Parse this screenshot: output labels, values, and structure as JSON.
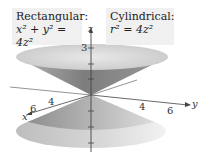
{
  "labels": {
    "rectangular": {
      "title": "Rectangular:",
      "equation": "x² + y² = 4z²"
    },
    "cylindrical": {
      "title": "Cylindrical:",
      "equation": "r² = 4z²"
    }
  },
  "axes": {
    "z": {
      "label": "z",
      "ticks": [
        "3"
      ]
    },
    "x": {
      "label": "x",
      "ticks": [
        "4",
        "6"
      ]
    },
    "y": {
      "label": "y",
      "ticks": [
        "4",
        "6"
      ]
    }
  },
  "colors": {
    "cone_outer": "#8a8a8a",
    "cone_rim": "#d8d8d8",
    "label_bg": "#f0f0f0"
  }
}
